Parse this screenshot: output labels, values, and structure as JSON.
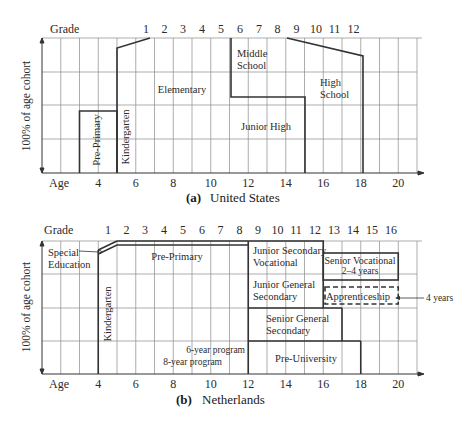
{
  "figure_label": "Figure 2.3",
  "axis_labels": {
    "grade": "Grade",
    "age": "Age",
    "ylabel": "100% of age cohort"
  },
  "panel_a": {
    "caption_letter": "(a)",
    "caption_text": "United States",
    "grade_ticks": [
      "1",
      "2",
      "3",
      "4",
      "5",
      "6",
      "7",
      "8",
      "9",
      "10",
      "11",
      "12"
    ],
    "age_ticks": [
      "4",
      "6",
      "8",
      "10",
      "12",
      "14",
      "16",
      "18",
      "20"
    ],
    "regions": {
      "pre_primary": "Pre-Primary",
      "kindergarten": "Kindergarten",
      "elementary": "Elementary",
      "middle_school_1": "Middle",
      "middle_school_2": "School",
      "junior_high": "Junior High",
      "high_school_1": "High",
      "high_school_2": "School"
    }
  },
  "panel_b": {
    "caption_letter": "(b)",
    "caption_text": "Netherlands",
    "grade_ticks": [
      "1",
      "2",
      "3",
      "4",
      "5",
      "6",
      "7",
      "8",
      "9",
      "10",
      "11",
      "12",
      "13",
      "14",
      "15",
      "16"
    ],
    "age_ticks": [
      "4",
      "6",
      "8",
      "10",
      "12",
      "14",
      "16",
      "18",
      "20"
    ],
    "regions": {
      "special_education_1": "Special",
      "special_education_2": "Education",
      "pre_primary": "Pre-Primary",
      "kindergarten": "Kindergarten",
      "six_year_program": "6-year program",
      "eight_year_program": "8-year program",
      "junior_secondary_vocational_1": "Junior Secondary",
      "junior_secondary_vocational_2": "Vocational",
      "junior_general_secondary_1": "Junior General",
      "junior_general_secondary_2": "Secondary",
      "senior_vocational_1": "Senior Vocational",
      "senior_vocational_2": "2–4 years",
      "apprenticeship": "Apprenticeship",
      "apprenticeship_note": "4 years",
      "senior_general_secondary_1": "Senior General",
      "senior_general_secondary_2": "Secondary",
      "pre_university": "Pre-University"
    }
  },
  "colors": {
    "line": "#333333",
    "grid": "#8a8a8a",
    "text": "#2a2a2a"
  }
}
